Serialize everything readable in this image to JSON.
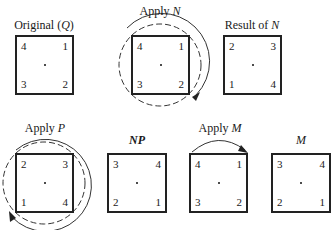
{
  "row1": {
    "original": {
      "label_prefix": "Original (",
      "label_symbol": "Q",
      "label_suffix": ")",
      "corners": {
        "tl": "4",
        "tr": "1",
        "bl": "3",
        "br": "2"
      }
    },
    "apply_n": {
      "label_prefix": "Apply ",
      "label_symbol": "N",
      "corners": {
        "tl": "4",
        "tr": "1",
        "bl": "3",
        "br": "2"
      },
      "rotation": "clockwise"
    },
    "result_n": {
      "label_prefix": "Result of ",
      "label_symbol": "N",
      "corners": {
        "tl": "2",
        "tr": "3",
        "bl": "1",
        "br": "4"
      }
    }
  },
  "row2": {
    "apply_p": {
      "label_prefix": "Apply ",
      "label_symbol": "P",
      "corners": {
        "tl": "2",
        "tr": "3",
        "bl": "1",
        "br": "4"
      },
      "rotation": "counterclockwise"
    },
    "np": {
      "label_symbol": "NP",
      "corners": {
        "tl": "3",
        "tr": "4",
        "bl": "2",
        "br": "1"
      }
    },
    "apply_m": {
      "label_prefix": "Apply ",
      "label_symbol": "M",
      "corners": {
        "tl": "4",
        "tr": "1",
        "bl": "3",
        "br": "2"
      },
      "flip": "horizontal"
    },
    "m": {
      "label_symbol": "M",
      "corners": {
        "tl": "3",
        "tr": "4",
        "bl": "2",
        "br": "1"
      }
    }
  }
}
